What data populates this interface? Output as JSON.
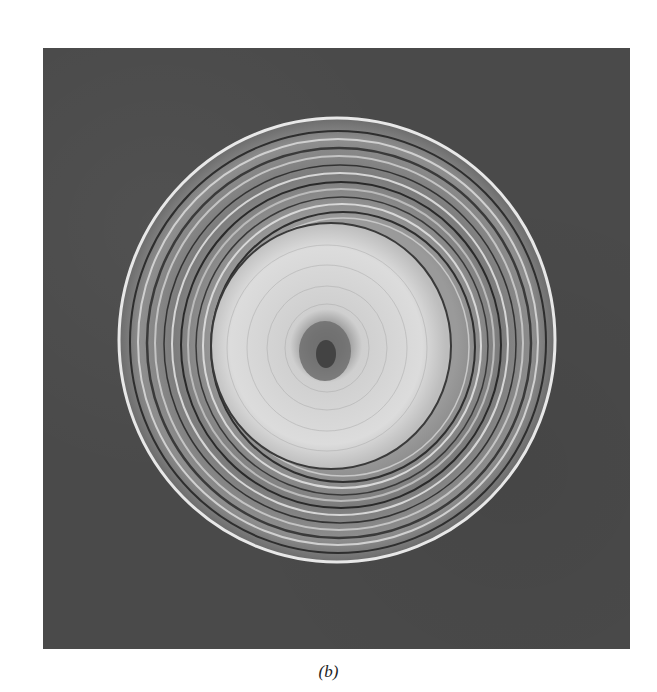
{
  "figure": {
    "caption": "(b)",
    "colors": {
      "background": "#ffffff",
      "panel": "#4a4a4a",
      "core_light": "#d8d8d8",
      "center_dark": "#5a5a5a",
      "rim_light": "#e6e6e6"
    }
  }
}
